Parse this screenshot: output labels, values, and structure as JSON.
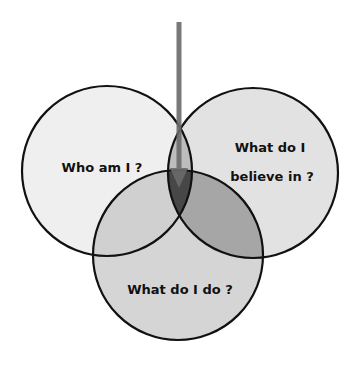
{
  "diagram": {
    "type": "venn-3",
    "circles": [
      {
        "id": "left",
        "label_lines": [
          "Who am I ?"
        ],
        "cx": 107,
        "cy": 171,
        "r": 85,
        "fill": "#efefef"
      },
      {
        "id": "right",
        "label_lines": [
          "What do I",
          "believe in ?"
        ],
        "cx": 253,
        "cy": 173,
        "r": 85,
        "fill": "#e2e2e2"
      },
      {
        "id": "bottom",
        "label_lines": [
          "What do I do ?"
        ],
        "cx": 178,
        "cy": 255,
        "r": 85,
        "fill": "#d5d5d5"
      }
    ],
    "overlap_colors": {
      "left_right": "#bdbdbd",
      "left_bottom": "#d0d0d0",
      "right_bottom": "#a6a6a6",
      "all_three": "#474747"
    },
    "stroke_color": "#111111",
    "arrow": {
      "x": 179,
      "y_start": 22,
      "y_end": 188,
      "color": "#6b6b6b",
      "direction": "down",
      "target": "center-intersection"
    }
  },
  "labels": {
    "left": "Who am I ?",
    "right_line1": "What do I",
    "right_line2": "believe in ?",
    "bottom": "What do I do ?"
  }
}
